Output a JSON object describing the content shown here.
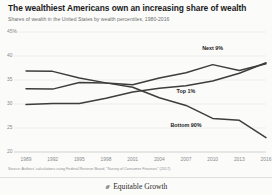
{
  "header": {
    "title": "The wealthiest Americans own an increasing share of wealth",
    "subtitle": "Shares of wealth in the United States by wealth percentiles, 1980-2016"
  },
  "footer": {
    "source": "Source: Authors' calculations using Federal Reserve Board, \"Survey of Consumer Finances\" (2017).",
    "brand": "Equitable Growth",
    "leaf_icon": "leaf-icon"
  },
  "colors": {
    "line": "#3d3d3d",
    "grid": "#e8e8e6",
    "tick_text": "#8a8a8a",
    "title_text": "#1a1a1a",
    "subtitle_text": "#6d6d6d",
    "background": "#fbfbfa"
  },
  "chart_data": {
    "type": "line",
    "title": "The wealthiest Americans own an increasing share of wealth",
    "subtitle": "Shares of wealth in the United States by wealth percentiles, 1980-2016",
    "xlabel": "",
    "ylabel": "",
    "x": [
      1989,
      1992,
      1995,
      1998,
      2001,
      2004,
      2007,
      2010,
      2013,
      2016
    ],
    "xtick_labels": [
      "1989",
      "1992",
      "1995",
      "1998",
      "2001",
      "2004",
      "2007",
      "2010",
      "2013",
      "2016"
    ],
    "ylim": [
      20,
      45
    ],
    "ytick_values": [
      45,
      40,
      35,
      30,
      25,
      20
    ],
    "ytick_labels": [
      "45%",
      "40",
      "35",
      "30",
      "25",
      "20"
    ],
    "grid": true,
    "legend_position": "inline-labels",
    "series": [
      {
        "name": "Next 9%",
        "label": "Next 9%",
        "label_x": 2010,
        "label_y": 41.6,
        "values": [
          36.9,
          36.8,
          35.4,
          34.4,
          34.0,
          35.4,
          36.5,
          38.2,
          37.0,
          38.4
        ]
      },
      {
        "name": "Top 1%",
        "label": "Top 1%",
        "label_x": 2007,
        "label_y": 32.6,
        "values": [
          29.9,
          30.1,
          30.1,
          31.2,
          32.5,
          33.3,
          33.8,
          34.8,
          36.4,
          38.6
        ]
      },
      {
        "name": "Bottom 90%",
        "label": "Bottom 90%",
        "label_x": 2007,
        "label_y": 25.6,
        "values": [
          33.2,
          33.1,
          34.5,
          34.4,
          33.5,
          31.3,
          29.7,
          27.0,
          26.6,
          23.0
        ]
      }
    ]
  }
}
